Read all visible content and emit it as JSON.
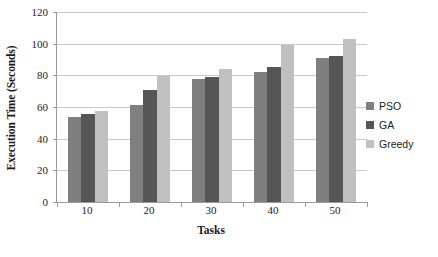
{
  "chart_data": {
    "type": "bar",
    "title": "",
    "xlabel": "Tasks",
    "ylabel": "Execution Time (Seconds)",
    "categories": [
      "10",
      "20",
      "30",
      "40",
      "50"
    ],
    "series": [
      {
        "name": "PSO",
        "color": "#7f7f7f",
        "values": [
          54,
          61,
          77.5,
          82,
          91
        ]
      },
      {
        "name": "GA",
        "color": "#565656",
        "values": [
          55.5,
          70.5,
          79,
          85,
          92.5
        ]
      },
      {
        "name": "Greedy",
        "color": "#c0c0c0",
        "values": [
          57.5,
          79.5,
          84,
          99,
          103
        ]
      }
    ],
    "ylim": [
      0,
      120
    ],
    "yticks": [
      0,
      20,
      40,
      60,
      80,
      100,
      120
    ],
    "ytick_labels": [
      "0",
      "20",
      "40",
      "60",
      "80",
      "100",
      "120"
    ],
    "grid": true,
    "legend_position": "right"
  },
  "legend": {
    "items": [
      {
        "label": "PSO"
      },
      {
        "label": "GA"
      },
      {
        "label": "Greedy"
      }
    ]
  },
  "axes": {
    "y_title": "Execution Time (Seconds)",
    "x_title": "Tasks"
  },
  "colors": {
    "pso": "#7f7f7f",
    "ga": "#565656",
    "greedy": "#c0c0c0",
    "gridline": "#c9c9c9",
    "axis": "#9a9a9a",
    "text": "#1a1a1a",
    "background": "#ffffff"
  }
}
